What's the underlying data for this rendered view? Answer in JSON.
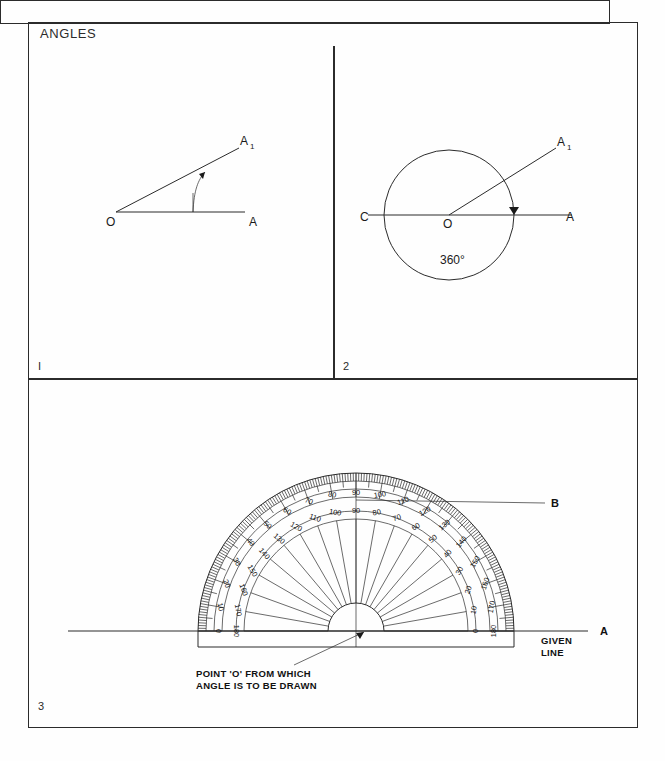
{
  "sheet": {
    "title": "ANGLES",
    "background": "#fefefe",
    "ink": "#2b2b2b"
  },
  "panels": [
    {
      "number": "I",
      "name": "acute-angle-figure",
      "labels": {
        "vertex": "O",
        "base_ray_end": "A",
        "rotated_ray_end": "A",
        "rotated_ray_sub": "1"
      }
    },
    {
      "number": "2",
      "name": "full-circle-figure",
      "labels": {
        "vertex": "O",
        "left_end": "C",
        "right_end": "A",
        "rotated_ray_end": "A",
        "rotated_ray_sub": "1",
        "full_turn": "360°"
      }
    },
    {
      "number": "3",
      "name": "protractor-figure",
      "labels": {
        "point_b": "B",
        "given_line_1": "GIVEN",
        "given_line_2": "LINE",
        "line_end": "A",
        "callout_line_1": "POINT 'O' FROM WHICH",
        "callout_line_2": "ANGLE IS TO BE DRAWN"
      }
    }
  ],
  "protractor": {
    "name": "semicircular-protractor",
    "outer_scale_label": "outer-scale-0-to-180-left-to-right",
    "inner_scale_label": "inner-scale-180-to-0-left-to-right",
    "outer_scale": [
      0,
      10,
      20,
      30,
      40,
      50,
      60,
      70,
      80,
      90,
      100,
      110,
      120,
      130,
      140,
      150,
      160,
      170,
      180
    ],
    "inner_scale": [
      180,
      170,
      160,
      150,
      140,
      130,
      120,
      110,
      100,
      90,
      80,
      70,
      60,
      50,
      40,
      30,
      20,
      10,
      0
    ],
    "minor_tick_degrees": 1,
    "radial_line_step_degrees": 10,
    "center_cutout": true
  }
}
